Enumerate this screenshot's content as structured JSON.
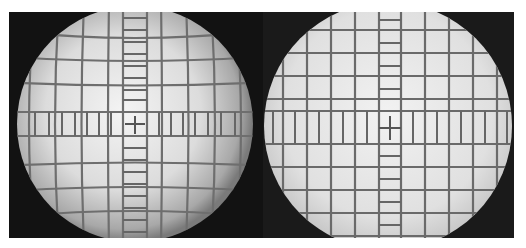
{
  "figure": {
    "panels": [
      {
        "id": "left",
        "label": "distorted view",
        "distortion": "barrel",
        "circle": {
          "cx": 126,
          "cy": 112,
          "r": 118
        },
        "grid_spacing": 26,
        "field_color_center": "#f2f2f2",
        "field_color_edge": "#8a8a8a",
        "line_color": "#6e6e6e"
      },
      {
        "id": "right",
        "label": "corrected view",
        "distortion": "none",
        "circle": {
          "cx": 125,
          "cy": 114,
          "r": 124
        },
        "grid_spacing": 23,
        "field_color_center": "#f0f0f0",
        "field_color_edge": "#b8b8b8",
        "line_color": "#6a6a6a"
      }
    ],
    "colors": {
      "background": "#ffffff",
      "outside_field": "#141414"
    }
  }
}
